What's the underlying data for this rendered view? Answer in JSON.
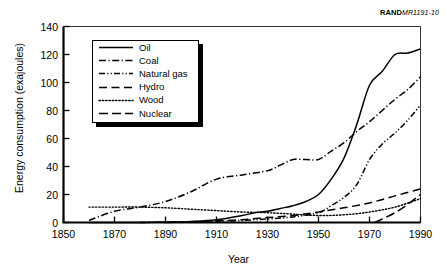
{
  "source_id": {
    "bold": "RAND",
    "italic": "MR1191-10"
  },
  "axes": {
    "ylabel": "Energy consumption (exajoules)",
    "xlabel": "Year",
    "yticks": [
      0,
      20,
      40,
      60,
      80,
      100,
      120,
      140
    ],
    "xticks": [
      1850,
      1870,
      1890,
      1910,
      1930,
      1950,
      1970,
      1990
    ]
  },
  "legend": {
    "items": [
      {
        "label": "Oil",
        "style": "solid"
      },
      {
        "label": "Coal",
        "style": "dash-dot"
      },
      {
        "label": "Natural gas",
        "style": "dash-dot-dot"
      },
      {
        "label": "Hydro",
        "style": "long-dash"
      },
      {
        "label": "Wood",
        "style": "dotted"
      },
      {
        "label": "Nuclear",
        "style": "long-dash-wide"
      }
    ]
  },
  "chart_data": {
    "type": "line",
    "title": "",
    "xlabel": "Year",
    "ylabel": "Energy consumption (exajoules)",
    "xlim": [
      1850,
      1990
    ],
    "ylim": [
      0,
      140
    ],
    "ytick_step": 20,
    "xtick_step": 20,
    "grid": false,
    "legend_position": "upper-left-inside",
    "series": [
      {
        "name": "Oil",
        "style": "solid",
        "x": [
          1860,
          1870,
          1880,
          1890,
          1900,
          1910,
          1920,
          1925,
          1930,
          1935,
          1940,
          1945,
          1950,
          1955,
          1960,
          1965,
          1970,
          1975,
          1980,
          1985,
          1990
        ],
        "values": [
          0,
          0,
          0,
          0.3,
          0.8,
          2,
          5,
          7,
          8,
          10,
          12,
          15,
          20,
          31,
          46,
          70,
          98,
          108,
          120,
          121,
          124
        ]
      },
      {
        "name": "Coal",
        "style": "dash-dot",
        "x": [
          1860,
          1870,
          1880,
          1890,
          1900,
          1910,
          1920,
          1930,
          1935,
          1940,
          1945,
          1950,
          1955,
          1960,
          1965,
          1970,
          1975,
          1980,
          1985,
          1990
        ],
        "values": [
          1.5,
          8,
          11,
          15,
          22,
          31,
          34,
          37,
          41,
          45,
          45,
          45,
          51,
          57,
          65,
          72,
          80,
          88,
          95,
          104
        ]
      },
      {
        "name": "Natural gas",
        "style": "dash-dot-dot",
        "x": [
          1880,
          1890,
          1900,
          1910,
          1920,
          1930,
          1940,
          1950,
          1955,
          1960,
          1965,
          1970,
          1975,
          1980,
          1985,
          1990
        ],
        "values": [
          0,
          0.2,
          0.4,
          0.8,
          1.5,
          2.5,
          4,
          7,
          12,
          18,
          27,
          45,
          56,
          64,
          73,
          84
        ]
      },
      {
        "name": "Hydro",
        "style": "long-dash",
        "x": [
          1890,
          1900,
          1910,
          1920,
          1930,
          1940,
          1950,
          1960,
          1970,
          1980,
          1990
        ],
        "values": [
          0,
          0.4,
          1,
          2,
          3.5,
          5,
          7.5,
          10.5,
          14,
          19,
          24
        ]
      },
      {
        "name": "Wood",
        "style": "dotted",
        "x": [
          1860,
          1870,
          1880,
          1890,
          1900,
          1910,
          1920,
          1930,
          1940,
          1950,
          1960,
          1970,
          1980,
          1990
        ],
        "values": [
          11,
          11,
          11,
          10.5,
          9.5,
          8.5,
          7.5,
          7,
          6,
          5,
          5.5,
          7.5,
          11,
          17
        ]
      },
      {
        "name": "Nuclear",
        "style": "long-dash-wide",
        "x": [
          1972,
          1975,
          1980,
          1985,
          1990
        ],
        "values": [
          0,
          2.5,
          7,
          13,
          20
        ]
      }
    ]
  }
}
